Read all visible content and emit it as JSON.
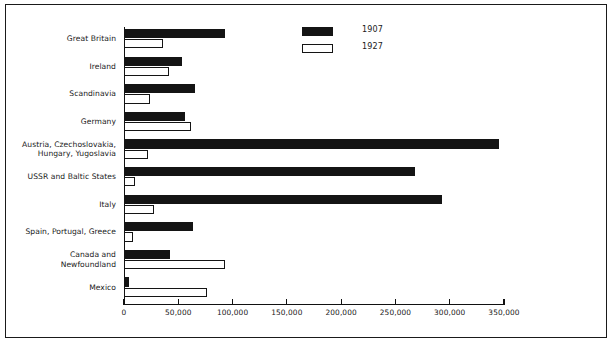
{
  "chart_data": {
    "type": "bar",
    "orientation": "horizontal",
    "title": "",
    "xlabel": "",
    "ylabel": "",
    "xlim": [
      0,
      350000
    ],
    "grid": false,
    "legend_position": "top-right",
    "categories": [
      "Great Britain",
      "Ireland",
      "Scandinavia",
      "Germany",
      "Austria, Czechoslovakia,\nHungary, Yugoslavia",
      "USSR and Baltic States",
      "Italy",
      "Spain, Portugal, Greece",
      "Canada and\nNewfoundland",
      "Mexico"
    ],
    "category_lines": [
      [
        "Great Britain"
      ],
      [
        "Ireland"
      ],
      [
        "Scandinavia"
      ],
      [
        "Germany"
      ],
      [
        "Austria, Czechoslovakia,",
        "Hungary, Yugoslavia"
      ],
      [
        "USSR and Baltic States"
      ],
      [
        "Italy"
      ],
      [
        "Spain, Portugal, Greece"
      ],
      [
        "Canada and",
        "Newfoundland"
      ],
      [
        "Mexico"
      ]
    ],
    "series": [
      {
        "name": "1907",
        "color": "#141414",
        "values": [
          93000,
          53000,
          65000,
          56000,
          345000,
          268000,
          293000,
          64000,
          42000,
          5000
        ]
      },
      {
        "name": "1927",
        "color": "#ffffff",
        "values": [
          36000,
          41000,
          24000,
          62000,
          22000,
          10000,
          28000,
          8000,
          93000,
          76000
        ]
      }
    ],
    "xticks": [
      0,
      50000,
      100000,
      150000,
      200000,
      250000,
      300000,
      350000
    ],
    "xtick_labels": [
      "0",
      "50,000",
      "100,000",
      "150,000",
      "200,000",
      "250,000",
      "300,000",
      "350,000"
    ]
  },
  "legend": {
    "entries": [
      {
        "label": "1907",
        "swatch": "filled-black"
      },
      {
        "label": "1927",
        "swatch": "outlined-white"
      }
    ]
  }
}
